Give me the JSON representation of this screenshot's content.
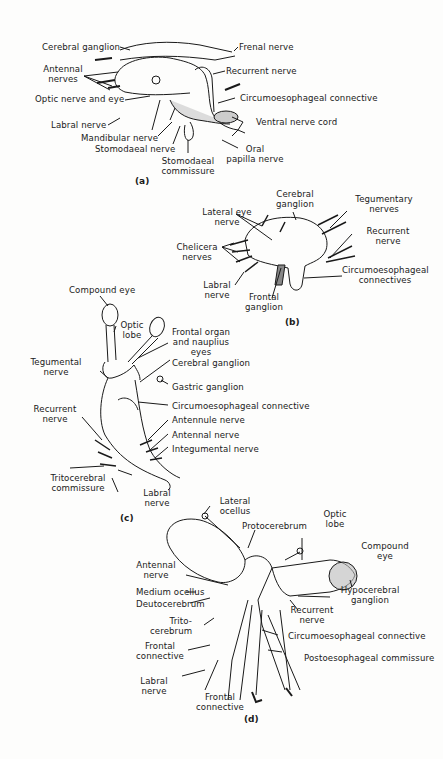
{
  "panels": {
    "a": {
      "tag": "(a)",
      "labels": {
        "cerebral_ganglion": "Cerebral ganglion",
        "frenal_nerve": "Frenal nerve",
        "antennal_nerves_1": "Antennal",
        "antennal_nerves_2": "nerves",
        "recurrent_nerve": "Recurrent nerve",
        "optic_nerve_eye": "Optic nerve and eye",
        "circumoesophageal": "Circumoesophageal connective",
        "labral_nerve": "Labral nerve",
        "ventral_nerve_cord": "Ventral nerve cord",
        "mandibular_nerve": "Mandibular nerve",
        "stomodaeal_nerve": "Stomodaeal nerve",
        "oral_1": "Oral",
        "oral_2": "papilla nerve",
        "stomodaeal_comm_1": "Stomodaeal",
        "stomodaeal_comm_2": "commissure"
      }
    },
    "b": {
      "tag": "(b)",
      "labels": {
        "cerebral_1": "Cerebral",
        "cerebral_2": "ganglion",
        "tegumentary_1": "Tegumentary",
        "tegumentary_2": "nerves",
        "lateral_eye_1": "Lateral eye",
        "lateral_eye_2": "nerve",
        "recurrent_1": "Recurrent",
        "recurrent_2": "nerve",
        "chelicera_1": "Chelicera",
        "chelicera_2": "nerves",
        "circum_1": "Circumoesophageal",
        "circum_2": "connectives",
        "labral_1": "Labral",
        "labral_2": "nerve",
        "frontal_1": "Frontal",
        "frontal_2": "ganglion"
      }
    },
    "c": {
      "tag": "(c)",
      "labels": {
        "compound_eye": "Compound eye",
        "optic_1": "Optic",
        "optic_2": "lobe",
        "frontal_organ_1": "Frontal organ",
        "frontal_organ_2": "and nauplius",
        "frontal_organ_3": "eyes",
        "tegumental_1": "Tegumental",
        "tegumental_2": "nerve",
        "cerebral_ganglion": "Cerebral ganglion",
        "gastric_ganglion": "Gastric ganglion",
        "recurrent_1": "Recurrent",
        "recurrent_2": "nerve",
        "circumoesophageal": "Circumoesophageal connective",
        "antennule_nerve": "Antennule nerve",
        "antennal_nerve": "Antennal nerve",
        "integumental_nerve": "Integumental nerve",
        "tritocerebral_1": "Tritocerebral",
        "tritocerebral_2": "commissure",
        "labral_1": "Labral",
        "labral_2": "nerve"
      }
    },
    "d": {
      "tag": "(d)",
      "labels": {
        "lateral_ocellus_1": "Lateral",
        "lateral_ocellus_2": "ocellus",
        "protocerebrum": "Protocerebrum",
        "optic_1": "Optic",
        "optic_2": "lobe",
        "compound_1": "Compound",
        "compound_2": "eye",
        "antennal_1": "Antennal",
        "antennal_2": "nerve",
        "medium_ocellus": "Medium ocellus",
        "hypocerebral_1": "Hypocerebral",
        "hypocerebral_2": "ganglion",
        "deutocerebrum": "Deutocerebrum",
        "recurrent_1": "Recurrent",
        "recurrent_2": "nerve",
        "trito_1": "Trito-",
        "trito_2": "cerebrum",
        "circumoesophageal": "Circumoesophageal connective",
        "frontal_conn_1": "Frontal",
        "frontal_conn_2": "connective",
        "postoesophageal": "Postoesophageal commissure",
        "labral_1": "Labral",
        "labral_2": "nerve",
        "frontal_conn_b1": "Frontal",
        "frontal_conn_b2": "connective"
      }
    }
  }
}
